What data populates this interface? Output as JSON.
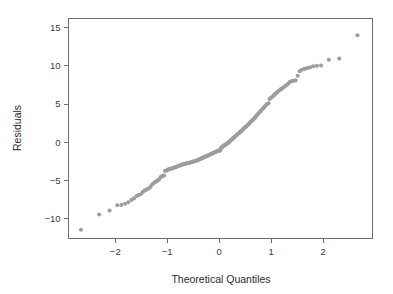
{
  "chart_data": {
    "type": "scatter",
    "title": "",
    "subtitle": "",
    "xlabel": "Theoretical Quantiles",
    "ylabel": "Residuals",
    "xlim": [
      -2.9,
      2.95
    ],
    "ylim": [
      -12.6,
      16.2
    ],
    "grid": false,
    "legend": null,
    "xticks": [
      -2,
      -1,
      0,
      1,
      2
    ],
    "xticklabels": [
      "−2",
      "−1",
      "0",
      "1",
      "2"
    ],
    "yticks": [
      -10,
      -5,
      0,
      5,
      10,
      15
    ],
    "yticklabels": [
      "−10",
      "−5",
      "0",
      "5",
      "10",
      "15"
    ],
    "marker": {
      "shape": "circle",
      "color": "#9d9d9d",
      "size_px": 4.1
    },
    "annotations": [],
    "n_points": 180,
    "series": [
      {
        "name": "Normal Q-Q residuals",
        "x": [
          -2.66,
          -2.31,
          -2.11,
          -1.96,
          -1.88,
          -1.81,
          -1.75,
          -1.69,
          -1.64,
          -1.59,
          -1.55,
          -1.51,
          -1.47,
          -1.43,
          -1.4,
          -1.36,
          -1.33,
          -1.3,
          -1.27,
          -1.24,
          -1.21,
          -1.19,
          -1.16,
          -1.13,
          -1.11,
          -1.08,
          -1.06,
          -1.04,
          -1.01,
          -0.99,
          -0.97,
          -0.95,
          -0.92,
          -0.9,
          -0.88,
          -0.86,
          -0.84,
          -0.82,
          -0.8,
          -0.78,
          -0.76,
          -0.74,
          -0.72,
          -0.7,
          -0.69,
          -0.67,
          -0.65,
          -0.63,
          -0.61,
          -0.59,
          -0.58,
          -0.56,
          -0.54,
          -0.52,
          -0.51,
          -0.49,
          -0.47,
          -0.45,
          -0.44,
          -0.42,
          -0.4,
          -0.39,
          -0.37,
          -0.35,
          -0.34,
          -0.32,
          -0.3,
          -0.29,
          -0.27,
          -0.26,
          -0.24,
          -0.22,
          -0.21,
          -0.19,
          -0.18,
          -0.16,
          -0.14,
          -0.13,
          -0.11,
          -0.1,
          -0.08,
          -0.06,
          -0.05,
          -0.03,
          -0.02,
          0.0,
          0.02,
          0.03,
          0.05,
          0.06,
          0.08,
          0.1,
          0.11,
          0.13,
          0.14,
          0.16,
          0.18,
          0.19,
          0.21,
          0.22,
          0.24,
          0.26,
          0.27,
          0.29,
          0.3,
          0.32,
          0.34,
          0.35,
          0.37,
          0.39,
          0.4,
          0.42,
          0.44,
          0.45,
          0.47,
          0.49,
          0.51,
          0.52,
          0.54,
          0.56,
          0.58,
          0.59,
          0.61,
          0.63,
          0.65,
          0.67,
          0.69,
          0.7,
          0.72,
          0.74,
          0.76,
          0.78,
          0.8,
          0.82,
          0.84,
          0.86,
          0.88,
          0.9,
          0.92,
          0.95,
          0.97,
          0.99,
          1.01,
          1.04,
          1.06,
          1.08,
          1.11,
          1.13,
          1.16,
          1.19,
          1.21,
          1.24,
          1.27,
          1.3,
          1.33,
          1.36,
          1.4,
          1.43,
          1.47,
          1.51,
          1.55,
          1.59,
          1.64,
          1.69,
          1.75,
          1.81,
          1.88,
          1.96,
          2.11,
          2.31,
          2.66
        ],
        "y": [
          -11.45,
          -9.45,
          -8.95,
          -8.25,
          -8.2,
          -8.05,
          -7.85,
          -7.55,
          -7.35,
          -7.05,
          -6.9,
          -6.8,
          -6.5,
          -6.3,
          -6.2,
          -6.05,
          -5.9,
          -5.6,
          -5.4,
          -5.25,
          -5.15,
          -5.0,
          -4.9,
          -4.6,
          -4.45,
          -4.4,
          -4.35,
          -3.75,
          -3.7,
          -3.6,
          -3.55,
          -3.5,
          -3.45,
          -3.4,
          -3.35,
          -3.3,
          -3.25,
          -3.2,
          -3.15,
          -3.1,
          -3.05,
          -3.0,
          -2.95,
          -2.9,
          -2.85,
          -2.85,
          -2.8,
          -2.78,
          -2.75,
          -2.72,
          -2.7,
          -2.65,
          -2.62,
          -2.58,
          -2.55,
          -2.5,
          -2.48,
          -2.45,
          -2.4,
          -2.35,
          -2.3,
          -2.25,
          -2.2,
          -2.15,
          -2.1,
          -2.05,
          -2.0,
          -1.95,
          -1.9,
          -1.85,
          -1.8,
          -1.75,
          -1.7,
          -1.65,
          -1.6,
          -1.55,
          -1.5,
          -1.45,
          -1.4,
          -1.35,
          -1.3,
          -1.25,
          -1.2,
          -1.15,
          -1.12,
          -1.1,
          -1.08,
          -0.8,
          -0.7,
          -0.6,
          -0.5,
          -0.42,
          -0.35,
          -0.28,
          -0.2,
          -0.12,
          -0.05,
          0.05,
          0.15,
          0.25,
          0.35,
          0.45,
          0.55,
          0.65,
          0.75,
          0.85,
          0.95,
          1.05,
          1.15,
          1.25,
          1.35,
          1.45,
          1.55,
          1.65,
          1.78,
          1.9,
          2.0,
          2.1,
          2.2,
          2.32,
          2.45,
          2.58,
          2.7,
          2.82,
          2.95,
          3.08,
          3.22,
          3.35,
          3.5,
          3.65,
          3.8,
          3.95,
          4.1,
          4.25,
          4.4,
          4.55,
          4.7,
          4.85,
          5.0,
          5.1,
          5.65,
          5.8,
          5.9,
          6.05,
          6.2,
          6.35,
          6.5,
          6.65,
          6.8,
          6.95,
          7.05,
          7.2,
          7.35,
          7.5,
          7.7,
          7.9,
          8.0,
          8.05,
          8.1,
          8.7,
          9.3,
          9.5,
          9.6,
          9.7,
          9.8,
          9.95,
          10.0,
          10.05,
          10.8,
          10.95,
          14.0
        ]
      }
    ]
  },
  "axes": {
    "x_title": "Theoretical Quantiles",
    "y_title": "Residuals"
  }
}
